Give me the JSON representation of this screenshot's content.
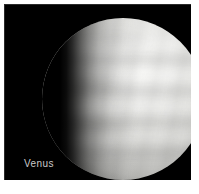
{
  "figure": {
    "subject": "Venus",
    "caption": "Venus",
    "media_type": "astronomical-photograph",
    "phase": "gibbous",
    "background_color": "#000000",
    "mount_color": "#ffffff",
    "caption_color": "#c9c9c9",
    "disc_color_bright": "#f7f7f5",
    "disc_color_mid": "#d2d2cf",
    "disc_color_dark": "#7d7d7a",
    "illumination_direction": "right",
    "terminator_side": "left"
  }
}
